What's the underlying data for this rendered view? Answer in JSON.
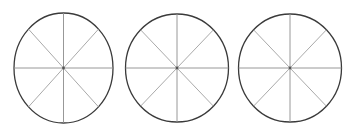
{
  "figure": {
    "title": "",
    "background_color": "#ffffff",
    "width": 355,
    "height": 140,
    "shape_count": 3,
    "shape_type": "circle-divided-into-sectors",
    "sectors_per_circle": 8,
    "sector_angle_degrees": 45,
    "shaded_sectors": 0,
    "outline_color": "#3a3a3a",
    "divider_color": "#8c8c8c",
    "fill_color": "#ffffff"
  },
  "circles": [
    {
      "label": "circle-1",
      "cx": 63.5,
      "cy": 68,
      "rx": 49.5,
      "ry": 55,
      "sectors": 8,
      "shaded": 0,
      "divider_angles": [
        0,
        45,
        90,
        135
      ]
    },
    {
      "label": "circle-2",
      "cx": 177,
      "cy": 68,
      "rx": 51.5,
      "ry": 54,
      "sectors": 8,
      "shaded": 0,
      "divider_angles": [
        0,
        45,
        90,
        135
      ]
    },
    {
      "label": "circle-3",
      "cx": 290,
      "cy": 68,
      "rx": 51.5,
      "ry": 54,
      "sectors": 8,
      "shaded": 0,
      "divider_angles": [
        0,
        45,
        90,
        135
      ]
    }
  ]
}
